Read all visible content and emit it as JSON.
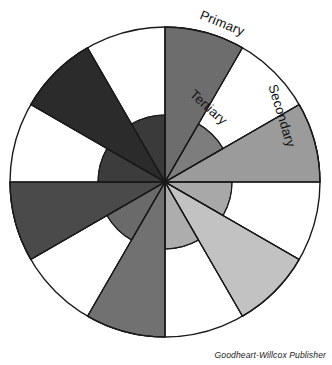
{
  "figure": {
    "credit": "Goodheart-Willcox Publisher",
    "geometry": {
      "center_x": 165,
      "center_y": 182,
      "outer_radius": 155,
      "inner_radius": 67,
      "spoke_count": 12,
      "wedge_degrees": 30
    },
    "labels": [
      {
        "id": "primary",
        "text": "Primary",
        "x": 222,
        "y": 24,
        "rotation": 22
      },
      {
        "id": "tertiary",
        "text": "Tertiary",
        "x": 208,
        "y": 108,
        "rotation": 42
      },
      {
        "id": "secondary",
        "text": "Secondary",
        "x": 281,
        "y": 116,
        "rotation": 73
      }
    ],
    "ring_note": "Inner disc filled on all twelve wedges; six alternating wedges extend to the outer rim, six stop at the inner disc leaving white.",
    "colors": {
      "outline": "#1a1a1a",
      "background": "#ffffff",
      "text": "#111111"
    }
  },
  "chart_data": {
    "type": "pie",
    "xlabel": "",
    "ylabel": "",
    "legend_position": "none",
    "grid": false,
    "categories": [
      "Primary (top)",
      "Tertiary",
      "Secondary",
      "Tertiary",
      "Primary",
      "Tertiary",
      "Secondary",
      "Tertiary",
      "Primary",
      "Tertiary",
      "Secondary",
      "Tertiary"
    ],
    "values": [
      30,
      30,
      30,
      30,
      30,
      30,
      30,
      30,
      30,
      30,
      30,
      30
    ],
    "series": [
      {
        "name": "wedges",
        "values": [
          30,
          30,
          30,
          30,
          30,
          30,
          30,
          30,
          30,
          30,
          30,
          30
        ]
      }
    ],
    "wedges": [
      {
        "index": 0,
        "start_deg": 0,
        "end_deg": 30,
        "tier": "Primary",
        "fill": "#6d6d6d",
        "extends_to_rim": true
      },
      {
        "index": 1,
        "start_deg": 30,
        "end_deg": 60,
        "tier": "Tertiary",
        "fill": "#7d7d7d",
        "extends_to_rim": false
      },
      {
        "index": 2,
        "start_deg": 60,
        "end_deg": 90,
        "tier": "Secondary",
        "fill": "#9b9b9b",
        "extends_to_rim": true
      },
      {
        "index": 3,
        "start_deg": 90,
        "end_deg": 120,
        "tier": "Tertiary",
        "fill": "#a8a8a8",
        "extends_to_rim": false
      },
      {
        "index": 4,
        "start_deg": 120,
        "end_deg": 150,
        "tier": "Primary",
        "fill": "#c2c2c2",
        "extends_to_rim": true
      },
      {
        "index": 5,
        "start_deg": 150,
        "end_deg": 180,
        "tier": "Tertiary",
        "fill": "#adadad",
        "extends_to_rim": false
      },
      {
        "index": 6,
        "start_deg": 180,
        "end_deg": 210,
        "tier": "Secondary",
        "fill": "#717171",
        "extends_to_rim": true
      },
      {
        "index": 7,
        "start_deg": 210,
        "end_deg": 240,
        "tier": "Tertiary",
        "fill": "#6a6a6a",
        "extends_to_rim": false
      },
      {
        "index": 8,
        "start_deg": 240,
        "end_deg": 270,
        "tier": "Primary",
        "fill": "#4a4a4a",
        "extends_to_rim": true
      },
      {
        "index": 9,
        "start_deg": 270,
        "end_deg": 300,
        "tier": "Tertiary",
        "fill": "#3c3c3c",
        "extends_to_rim": false
      },
      {
        "index": 10,
        "start_deg": 300,
        "end_deg": 330,
        "tier": "Secondary",
        "fill": "#2b2b2b",
        "extends_to_rim": true
      },
      {
        "index": 11,
        "start_deg": 330,
        "end_deg": 360,
        "tier": "Tertiary",
        "fill": "#3a3a3a",
        "extends_to_rim": false
      }
    ],
    "annotations": [
      {
        "text": "Primary"
      },
      {
        "text": "Tertiary"
      },
      {
        "text": "Secondary"
      }
    ]
  }
}
